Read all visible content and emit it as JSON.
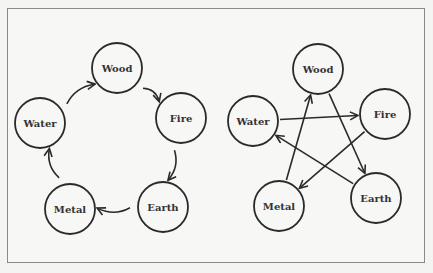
{
  "figure": {
    "diagrams": [
      {
        "name": "generating-cycle",
        "nodes": [
          {
            "id": "water",
            "label": "Water"
          },
          {
            "id": "wood",
            "label": "Wood"
          },
          {
            "id": "fire",
            "label": "Fire"
          },
          {
            "id": "earth",
            "label": "Earth"
          },
          {
            "id": "metal",
            "label": "Metal"
          }
        ],
        "edges": [
          {
            "from": "water",
            "to": "wood"
          },
          {
            "from": "wood",
            "to": "fire"
          },
          {
            "from": "fire",
            "to": "earth"
          },
          {
            "from": "earth",
            "to": "metal"
          },
          {
            "from": "metal",
            "to": "water"
          }
        ]
      },
      {
        "name": "controlling-cycle",
        "nodes": [
          {
            "id": "wood",
            "label": "Wood"
          },
          {
            "id": "water",
            "label": "Water"
          },
          {
            "id": "fire",
            "label": "Fire"
          },
          {
            "id": "metal",
            "label": "Metal"
          },
          {
            "id": "earth",
            "label": "Earth"
          }
        ],
        "edges": [
          {
            "from": "water",
            "to": "fire"
          },
          {
            "from": "fire",
            "to": "metal"
          },
          {
            "from": "metal",
            "to": "wood"
          },
          {
            "from": "wood",
            "to": "earth"
          },
          {
            "from": "earth",
            "to": "water"
          }
        ]
      }
    ],
    "colors": {
      "stroke": "#2a2a2a",
      "text": "#333333",
      "background": "#f4f4f3"
    }
  }
}
